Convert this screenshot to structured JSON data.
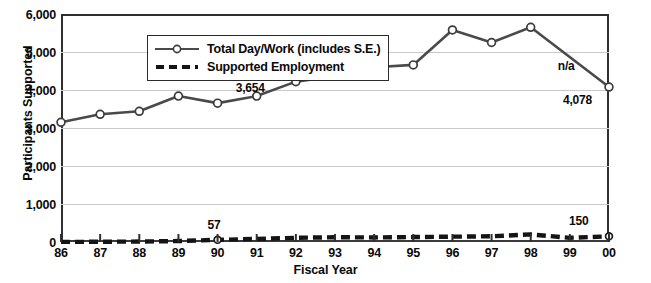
{
  "chart_data": {
    "type": "line",
    "title": "",
    "xlabel": "Fiscal Year",
    "ylabel": "Participants Supported",
    "categories": [
      "86",
      "87",
      "88",
      "89",
      "90",
      "91",
      "92",
      "93",
      "94",
      "95",
      "96",
      "97",
      "98",
      "99",
      "00"
    ],
    "ylim": [
      0,
      6000
    ],
    "ytick_labels": [
      "0",
      "1,000",
      "2,000",
      "3,000",
      "4,000",
      "5,000",
      "6,000"
    ],
    "ytick_values": [
      0,
      1000,
      2000,
      3000,
      4000,
      5000,
      6000
    ],
    "grid": "horizontal",
    "legend_position": "top-left-inside",
    "series": [
      {
        "name": "Total Day/Work (includes S.E.)",
        "style": "solid-with-open-circle-markers",
        "color": "#4a4a4a",
        "values": [
          3150,
          3360,
          3440,
          3840,
          3654,
          3840,
          4220,
          4360,
          4600,
          4660,
          5580,
          5250,
          5650,
          null,
          4078
        ]
      },
      {
        "name": "Supported Employment",
        "style": "thick-dashed",
        "color": "#141414",
        "values": [
          2,
          6,
          12,
          25,
          57,
          80,
          110,
          125,
          120,
          130,
          140,
          150,
          200,
          110,
          150
        ]
      }
    ],
    "annotations": [
      {
        "text": "3,654",
        "category": "91",
        "value": 3654,
        "position": "above"
      },
      {
        "text": "4,078",
        "category": "00",
        "value": 4078,
        "position": "below-left"
      },
      {
        "text": "n/a",
        "category": "99",
        "value": null,
        "position": "above-left",
        "note": "FY99 data not available"
      },
      {
        "text": "57",
        "category": "90",
        "value": 57,
        "position": "above"
      },
      {
        "text": "150",
        "category": "00",
        "value": 150,
        "position": "above-left"
      }
    ]
  },
  "axis": {
    "y_title": "Participants Supported",
    "x_title": "Fiscal Year",
    "y_ticks": [
      "6,000",
      "5,000",
      "4,000",
      "3,000",
      "2,000",
      "1,000",
      "0"
    ],
    "x_ticks": [
      "86",
      "87",
      "88",
      "89",
      "90",
      "91",
      "92",
      "93",
      "94",
      "95",
      "96",
      "97",
      "98",
      "99",
      "00"
    ]
  },
  "legend": {
    "items": [
      {
        "label": "Total Day/Work (includes S.E.)",
        "key": "line-circle-marker"
      },
      {
        "label": "Supported Employment",
        "key": "dashed-line"
      }
    ]
  },
  "annotations": {
    "peak_dip_91": "3,654",
    "end_total_00": "4,078",
    "missing_99": "n/a",
    "se_90": "57",
    "se_00": "150"
  },
  "header_remnant": "",
  "colors": {
    "total_line": "#4a4a4a",
    "se_line": "#141414",
    "gridline": "#c9c9c9",
    "frame": "#2f2f2f",
    "text": "#0a0a0a",
    "background": "#ffffff"
  }
}
